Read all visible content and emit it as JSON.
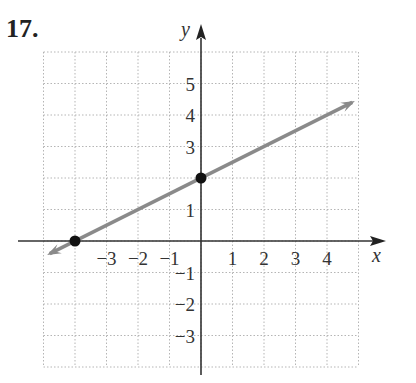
{
  "problem": {
    "number": "17."
  },
  "chart_data": {
    "type": "line",
    "title": "",
    "xlabel": "x",
    "ylabel": "y",
    "xlim": [
      -5,
      5
    ],
    "ylim": [
      -4,
      6
    ],
    "grid": true,
    "x_ticks": [
      -3,
      -2,
      -1,
      1,
      2,
      3,
      4
    ],
    "y_ticks": [
      5,
      4,
      3,
      1,
      -1,
      -2,
      -3
    ],
    "x_tick_labels": [
      "−3",
      "−2",
      "−1",
      "1",
      "2",
      "3",
      "4"
    ],
    "y_tick_labels": [
      "5",
      "4",
      "3",
      "1",
      "−1",
      "−2",
      "−3"
    ],
    "series": [
      {
        "name": "line",
        "equation": "y = 0.5x + 2",
        "slope": 0.5,
        "intercept": 2,
        "x": [
          -4.8,
          4.8
        ],
        "y": [
          -0.4,
          4.4
        ],
        "color": "#8a8a8a",
        "arrows": "both"
      }
    ],
    "points": [
      {
        "label": "x-intercept",
        "x": -4,
        "y": 0
      },
      {
        "label": "y-intercept",
        "x": 0,
        "y": 2
      }
    ]
  }
}
